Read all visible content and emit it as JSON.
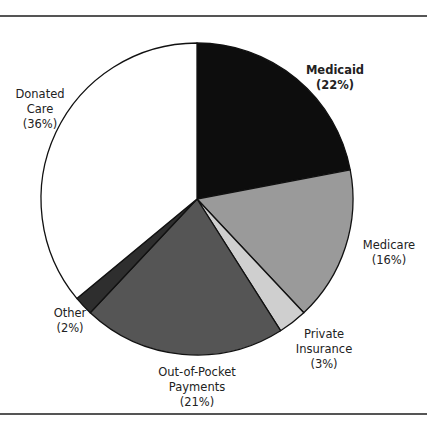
{
  "chart_data": {
    "type": "pie",
    "title": "",
    "start_angle_deg": 0,
    "direction": "clockwise",
    "slices": [
      {
        "label": "Medicaid",
        "value": 22,
        "pct_label": "(22%)",
        "color": "#0d0d0d"
      },
      {
        "label": "Medicare",
        "value": 16,
        "pct_label": "(16%)",
        "color": "#9a9a9a"
      },
      {
        "label": "Private Insurance",
        "value": 3,
        "pct_label": "(3%)",
        "color": "#cfcfcf"
      },
      {
        "label": "Out-of-Pocket Payments",
        "value": 21,
        "pct_label": "(21%)",
        "color": "#555555"
      },
      {
        "label": "Other",
        "value": 2,
        "pct_label": "(2%)",
        "color": "#2e2e2e"
      },
      {
        "label": "Donated Care",
        "value": 36,
        "pct_label": "(36%)",
        "color": "#ffffff"
      }
    ]
  },
  "labels": {
    "medicaid": {
      "line1": "Medicaid",
      "pct": "(22%)"
    },
    "medicare": {
      "line1": "Medicare",
      "pct": "(16%)"
    },
    "private": {
      "line1": "Private",
      "line2": "Insurance",
      "pct": "(3%)"
    },
    "oop": {
      "line1": "Out-of-Pocket",
      "line2": "Payments",
      "pct": "(21%)"
    },
    "other": {
      "line1": "Other",
      "pct": "(2%)"
    },
    "donated": {
      "line1": "Donated",
      "line2": "Care",
      "pct": "(36%)"
    }
  }
}
